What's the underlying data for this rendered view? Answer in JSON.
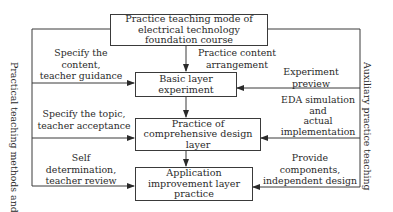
{
  "diagram": {
    "top_box": "Practice teaching mode of electrical technology foundation course",
    "top_box_lines": [
      "Practice teaching mode of",
      "electrical technology",
      "foundation course"
    ],
    "layers": [
      {
        "lines": [
          "Basic layer",
          "experiment"
        ]
      },
      {
        "lines": [
          "Practice of",
          "comprehensive design",
          "layer"
        ]
      },
      {
        "lines": [
          "Application",
          "improvement layer",
          "practice"
        ]
      }
    ],
    "center_label": [
      "Practice content",
      "arrangement"
    ],
    "left_side": {
      "title_lines": [
        "Practical teaching",
        "methods and means"
      ],
      "labels": [
        {
          "lines": [
            "Specify the",
            "content,",
            "teacher guidance"
          ]
        },
        {
          "lines": [
            "Specify the topic,",
            "teacher acceptance"
          ]
        },
        {
          "lines": [
            "Self",
            "determination,",
            "teacher review"
          ]
        }
      ]
    },
    "right_side": {
      "title_lines": [
        "Auxiliary practice",
        "teaching"
      ],
      "labels": [
        {
          "lines": [
            "Experiment",
            "preview"
          ]
        },
        {
          "lines": [
            "EDA simulation",
            "and",
            "actual",
            "implementation"
          ]
        },
        {
          "lines": [
            "Provide",
            "components,",
            "independent design"
          ]
        }
      ]
    },
    "line_color": "#3a3a3a"
  }
}
